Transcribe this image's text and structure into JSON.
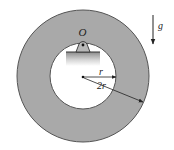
{
  "diagram": {
    "type": "physics-figure",
    "labels": {
      "pivot": "O",
      "gravity": "g",
      "inner_radius": "r",
      "outer_radius": "2r"
    },
    "colors": {
      "ring_fill": "#a9a9a9",
      "ring_edge": "#555555",
      "hole_fill": "#ffffff",
      "line": "#222222",
      "support_fill": "#9a9a9a"
    },
    "geometry": {
      "center": [
        83,
        76
      ],
      "outer_radius_px": 66,
      "inner_radius_px": 33,
      "pivot_point": [
        83,
        43
      ]
    }
  }
}
